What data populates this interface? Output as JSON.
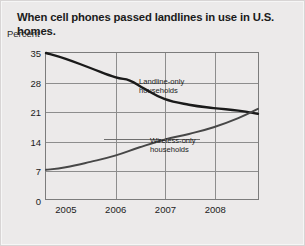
{
  "figure": {
    "title": "When cell phones passed landlines in use in U.S. homes.",
    "unit_label": "Percent"
  },
  "chart_data": {
    "type": "line",
    "title": "When cell phones passed landlines in use in U.S. homes.",
    "xlabel": "",
    "ylabel": "Percent",
    "ylim": [
      0,
      35
    ],
    "xlim": [
      2004.6,
      2008.9
    ],
    "grid": true,
    "legend": "inline-annotations",
    "yticks": [
      0,
      7,
      14,
      21,
      28,
      35
    ],
    "xticks": [
      2005,
      2006,
      2007,
      2008
    ],
    "ytick_labels": [
      "0",
      "7",
      "14",
      "21",
      "28",
      "35"
    ],
    "xtick_labels": [
      "2005",
      "2006",
      "2007",
      "2008"
    ],
    "series": [
      {
        "name": "Landline-only households",
        "annotation": "Landline-only\nhouseholds",
        "annotation_line1": "Landline-only",
        "annotation_line2": "households",
        "color": "#1a1a1a",
        "x": [
          2004.6,
          2005.0,
          2005.5,
          2006.0,
          2006.3,
          2006.6,
          2007.0,
          2007.5,
          2008.0,
          2008.5,
          2008.9
        ],
        "values": [
          35.0,
          33.6,
          31.4,
          29.2,
          28.4,
          26.4,
          24.0,
          22.6,
          21.8,
          21.2,
          20.4
        ]
      },
      {
        "name": "Wireless-only households",
        "annotation": "Wireless-only\nhouseholds",
        "annotation_line1": "Wireless-only",
        "annotation_line2": "households",
        "color": "#474747",
        "x": [
          2004.6,
          2005.0,
          2005.5,
          2006.0,
          2006.5,
          2007.0,
          2007.5,
          2008.0,
          2008.5,
          2008.9
        ],
        "values": [
          7.0,
          7.6,
          8.9,
          10.4,
          12.4,
          14.2,
          15.6,
          17.2,
          19.4,
          21.6
        ]
      }
    ],
    "crossover": {
      "approx_x": 2008.75,
      "approx_y": 21.0
    }
  }
}
